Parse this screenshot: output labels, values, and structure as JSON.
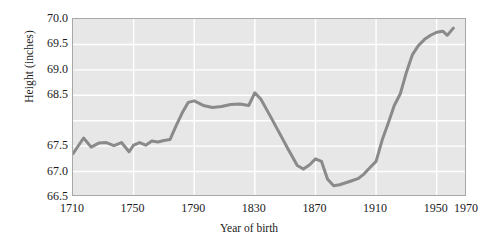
{
  "chart_data": {
    "type": "line",
    "title": "",
    "xlabel": "Year of birth",
    "ylabel": "Height (inches)",
    "xlim": [
      1710,
      1970
    ],
    "ylim": [
      66.5,
      70.0
    ],
    "xticks": [
      1710,
      1750,
      1790,
      1830,
      1870,
      1910,
      1950,
      1970
    ],
    "xticklabels": [
      "1710",
      "1750",
      "1790",
      "1830",
      "1870",
      "1910",
      "1950",
      "1970"
    ],
    "yticks": [
      66.5,
      67.0,
      67.5,
      68.5,
      69.0,
      69.5,
      70.0
    ],
    "yticklabels": [
      "66.5",
      "67.0",
      "67.5",
      "68.5",
      "69.0",
      "69.5",
      "70.0"
    ],
    "grid": true,
    "grid_color": "#ffffff",
    "panel_background": "#e7e7e7",
    "line_color": "#8a8a8a",
    "line_width": 3,
    "legend": null,
    "series": [
      {
        "name": "Mean height of men by year of birth",
        "x": [
          1710,
          1717,
          1722,
          1727,
          1732,
          1737,
          1742,
          1747,
          1750,
          1754,
          1758,
          1762,
          1766,
          1770,
          1774,
          1778,
          1782,
          1786,
          1790,
          1796,
          1802,
          1808,
          1814,
          1820,
          1826,
          1830,
          1834,
          1840,
          1846,
          1852,
          1858,
          1862,
          1866,
          1870,
          1874,
          1878,
          1882,
          1886,
          1890,
          1894,
          1898,
          1902,
          1906,
          1910,
          1914,
          1918,
          1922,
          1926,
          1930,
          1934,
          1938,
          1942,
          1946,
          1950,
          1954,
          1957,
          1961
        ],
        "y": [
          67.35,
          67.66,
          67.48,
          67.56,
          67.57,
          67.51,
          67.57,
          67.39,
          67.52,
          67.57,
          67.52,
          67.6,
          67.58,
          67.61,
          67.63,
          67.9,
          68.15,
          68.36,
          68.39,
          68.3,
          68.26,
          68.28,
          68.32,
          68.33,
          68.3,
          68.55,
          68.42,
          68.1,
          67.77,
          67.44,
          67.12,
          67.05,
          67.13,
          67.25,
          67.2,
          66.85,
          66.72,
          66.74,
          66.78,
          66.82,
          66.86,
          66.95,
          67.08,
          67.2,
          67.62,
          67.95,
          68.3,
          68.53,
          68.95,
          69.3,
          69.48,
          69.6,
          69.68,
          69.74,
          69.76,
          69.68,
          69.82
        ]
      }
    ]
  },
  "axes": {
    "y_title": "Height (inches)",
    "x_title": "Year of birth"
  }
}
